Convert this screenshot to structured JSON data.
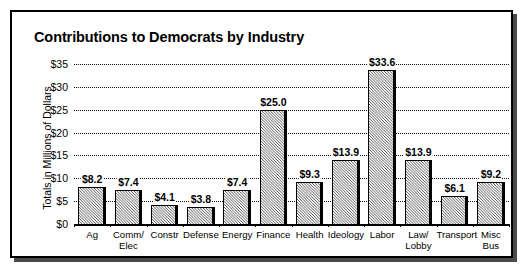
{
  "chart_data": {
    "type": "bar",
    "title": "Contributions to Democrats by Industry",
    "xlabel": "",
    "ylabel": "Totals in Millions of Dollars",
    "categories": [
      "Ag",
      "Comm/\nElec",
      "Constr",
      "Defense",
      "Energy",
      "Finance",
      "Health",
      "Ideology",
      "Labor",
      "Law/\nLobby",
      "Transport",
      "Misc Bus"
    ],
    "values": [
      8.2,
      7.4,
      4.1,
      3.8,
      7.4,
      25.0,
      9.3,
      13.9,
      33.6,
      13.9,
      6.1,
      9.2
    ],
    "data_labels": [
      "$8.2",
      "$7.4",
      "$4.1",
      "$3.8",
      "$7.4",
      "$25.0",
      "$9.3",
      "$13.9",
      "$33.6",
      "$13.9",
      "$6.1",
      "$9.2"
    ],
    "ylim": [
      0,
      35
    ],
    "yticks": [
      0,
      5,
      10,
      15,
      20,
      25,
      30,
      35
    ],
    "ytick_labels": [
      "$0",
      "$5",
      "$10",
      "$15",
      "$20",
      "$25",
      "$30",
      "$35"
    ],
    "grid": true,
    "legend": false,
    "bar_fill": "#808080",
    "bar_edge": "#000000",
    "background": "#ffffff"
  }
}
